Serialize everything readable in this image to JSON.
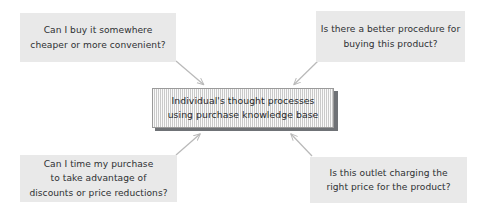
{
  "diagram": {
    "type": "concept-map",
    "title": "Individual's thought processes using purchase knowledge base",
    "center": {
      "id": "center-node",
      "line1": "Individual's thought processes",
      "line2": "using purchase knowledge base",
      "fill_color": "#dcdcdc",
      "border_color": "#9a9a9a",
      "shadow_color": "#6f7276",
      "texture": "vertical-hatch"
    },
    "question_boxes": [
      {
        "id": "top-left",
        "position": "top-left",
        "line1": "Can I buy it somewhere",
        "line2": "cheaper or more convenient?",
        "fill_color": "#e9e9e9",
        "text_color": "#2e3033"
      },
      {
        "id": "top-right",
        "position": "top-right",
        "line1": "Is there a better procedure for",
        "line2": "buying this product?",
        "fill_color": "#e9e9e9",
        "text_color": "#2e3033"
      },
      {
        "id": "bottom-left",
        "position": "bottom-left",
        "line1": "Can I time my purchase",
        "line2": "to take advantage of",
        "line3": "discounts or price reductions?",
        "fill_color": "#e9e9e9",
        "text_color": "#2e3033"
      },
      {
        "id": "bottom-right",
        "position": "bottom-right",
        "line1": "Is this outlet charging the",
        "line2": "right price for the product?",
        "fill_color": "#e9e9e9",
        "text_color": "#2e3033"
      }
    ],
    "connectors": [
      {
        "id": "arrow-top-left-to-center",
        "from": "top-left",
        "to": "center-node",
        "direction": "down-right",
        "color": "#b9b9b9"
      },
      {
        "id": "arrow-top-right-to-center",
        "from": "top-right",
        "to": "center-node",
        "direction": "down-left",
        "color": "#b9b9b9"
      },
      {
        "id": "arrow-bottom-left-to-center",
        "from": "bottom-left",
        "to": "center-node",
        "direction": "up-right",
        "color": "#b9b9b9"
      },
      {
        "id": "arrow-bottom-right-to-center",
        "from": "bottom-right",
        "to": "center-node",
        "direction": "up-left",
        "color": "#b9b9b9"
      }
    ],
    "background_color": "#ffffff"
  }
}
